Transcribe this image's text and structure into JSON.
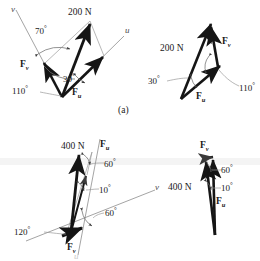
{
  "figure": {
    "caption": "(a)",
    "panels": [
      {
        "id": "top-left",
        "kind": "parallelogram-law",
        "resultant_label": "200 N",
        "axis_u": "u",
        "axis_v": "v",
        "component_v": "F",
        "component_v_sub": "v",
        "component_u": "F",
        "component_u_sub": "u",
        "angles": [
          "70°",
          "110°",
          "30°"
        ]
      },
      {
        "id": "top-right",
        "kind": "triangle-rule",
        "resultant_label": "200 N",
        "component_v": "F",
        "component_v_sub": "v",
        "component_u": "F",
        "component_u_sub": "u",
        "angles": [
          "30°",
          "110°"
        ]
      },
      {
        "id": "bottom-left",
        "kind": "parallelogram-law",
        "resultant_label": "400 N",
        "axis_u": "u",
        "axis_v": "v",
        "component_v": "F",
        "component_v_sub": "v",
        "component_u": "F",
        "component_u_sub": "u",
        "angles": [
          "60°",
          "10°",
          "60°",
          "120°"
        ]
      },
      {
        "id": "bottom-right",
        "kind": "triangle-rule",
        "resultant_label": "400 N",
        "component_v": "F",
        "component_v_sub": "v",
        "component_u": "F",
        "component_u_sub": "u",
        "angles": [
          "60°",
          "10°"
        ]
      }
    ]
  },
  "labels": {
    "n200_a": "200 N",
    "n200_b": "200 N",
    "n400_a": "400 N",
    "n400_b": "400 N",
    "a70": "70",
    "a110_a": "110",
    "a30_a": "30",
    "a30_b": "30",
    "a110_b": "110",
    "a60_a": "60",
    "a10_a": "10",
    "a60_b": "60",
    "a120": "120",
    "a60_c": "60",
    "a10_b": "10",
    "deg": "°",
    "axis_v_tl": "v",
    "axis_u_tl": "u",
    "axis_v_bl": "v",
    "axis_u_bl": "u",
    "F": "F",
    "sub_v": "v",
    "sub_u": "u",
    "caption_a": "(a)"
  },
  "colors": {
    "ink": "#1a1a1a",
    "thin_line": "#6e6e6e",
    "leader": "#8a8a8a",
    "background": "#ffffff",
    "band": "#f4f4f4"
  }
}
